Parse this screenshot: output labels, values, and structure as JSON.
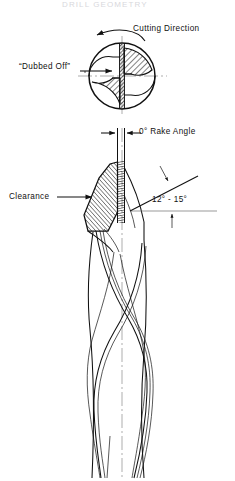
{
  "figure": {
    "page_header_fragment": "DRILL GEOMETRY",
    "background_color": "#ffffff",
    "line_color": "#111111",
    "centerline_color": "#8a8a8a"
  },
  "labels": {
    "cutting_direction": "Cutting Direction",
    "dubbed_off": "“Dubbed Off”",
    "rake_angle": "0°  Rake Angle",
    "clearance": "Clearance",
    "point_angle_range": "12° - 15°"
  },
  "annotations": {
    "rake_angle_value": "0°",
    "rake_angle_name": "Rake Angle",
    "clearance_angle_min": "12°",
    "clearance_angle_max": "15°",
    "rotation_sense": "counterclockwise"
  },
  "icons": {
    "rotation_arrow": "curved-arrow-left-icon",
    "dubbed_off_pointer": "arrow-right-icon",
    "clearance_pointer": "arrow-right-icon",
    "rake_dimension_left": "dimension-arrow-right-icon",
    "rake_dimension_right": "dimension-arrow-left-icon",
    "angle_pointer_upper": "arrow-down-right-icon",
    "angle_pointer_lower": "arrow-up-icon"
  },
  "views": {
    "end_view_name": "drill end cross-section view",
    "side_view_name": "drill side elevation view"
  }
}
